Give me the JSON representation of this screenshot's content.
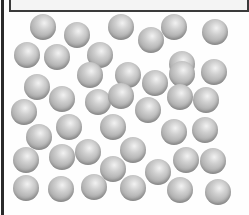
{
  "diagram": {
    "particle_count": 42,
    "particle_radius": 13,
    "colors": {
      "particle": "#b0b0b0",
      "wall": "#2a2a2a",
      "lid": "#f4f4f4",
      "background": "#fefefe"
    },
    "particles": [
      [
        43,
        27
      ],
      [
        77,
        35
      ],
      [
        121,
        27
      ],
      [
        151,
        40
      ],
      [
        174,
        27
      ],
      [
        215,
        32
      ],
      [
        27,
        55
      ],
      [
        57,
        57
      ],
      [
        100,
        55
      ],
      [
        128,
        75
      ],
      [
        182,
        64
      ],
      [
        214,
        72
      ],
      [
        37,
        87
      ],
      [
        62,
        99
      ],
      [
        90,
        75
      ],
      [
        98,
        102
      ],
      [
        121,
        96
      ],
      [
        155,
        83
      ],
      [
        182,
        74
      ],
      [
        24,
        112
      ],
      [
        148,
        110
      ],
      [
        180,
        97
      ],
      [
        206,
        100
      ],
      [
        39,
        137
      ],
      [
        69,
        127
      ],
      [
        113,
        127
      ],
      [
        174,
        132
      ],
      [
        205,
        130
      ],
      [
        26,
        160
      ],
      [
        62,
        157
      ],
      [
        88,
        152
      ],
      [
        113,
        169
      ],
      [
        133,
        150
      ],
      [
        158,
        172
      ],
      [
        186,
        160
      ],
      [
        213,
        161
      ],
      [
        26,
        188
      ],
      [
        61,
        189
      ],
      [
        94,
        187
      ],
      [
        133,
        188
      ],
      [
        180,
        190
      ],
      [
        218,
        192
      ]
    ]
  }
}
